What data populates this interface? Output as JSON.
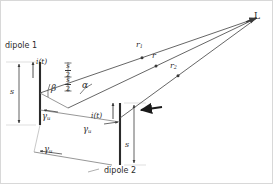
{
  "figure": {
    "type": "antenna-array-geometry-diagram",
    "background_color": "#ffffff",
    "line_color": "#3a3a3a",
    "text_color": "#2b2b2b",
    "observation_point": {
      "label": "L",
      "x": 257,
      "y": 18
    },
    "dipoles": [
      {
        "id": "dipole-1",
        "label": "dipole 1",
        "current_label": "i(t)",
        "length_label": "s",
        "center": {
          "x": 40,
          "y": 93
        },
        "top": {
          "x": 40,
          "y": 62
        },
        "bottom": {
          "x": 40,
          "y": 125
        }
      },
      {
        "id": "dipole-2",
        "label": "dipole 2",
        "current_label": "i(t)",
        "length_label": "s",
        "center": {
          "x": 120,
          "y": 118
        },
        "top": {
          "x": 120,
          "y": 103
        },
        "bottom": {
          "x": 120,
          "y": 165
        }
      }
    ],
    "rays": [
      {
        "id": "ray-r1",
        "label": "r",
        "sublabel": "1",
        "from_x": 40,
        "from_y": 93,
        "to_x": 257,
        "to_y": 18
      },
      {
        "id": "ray-r",
        "label": "r",
        "sublabel": "",
        "from_x": 68,
        "from_y": 108,
        "to_x": 257,
        "to_y": 18
      },
      {
        "id": "ray-r2",
        "label": "r",
        "sublabel": "2",
        "from_x": 120,
        "from_y": 118,
        "to_x": 257,
        "to_y": 18
      }
    ],
    "angles": [
      {
        "id": "angle-beta",
        "label": "β",
        "x": 53,
        "y": 89
      },
      {
        "id": "angle-alpha",
        "label": "α",
        "x": 84,
        "y": 86
      },
      {
        "id": "angle-psi-1",
        "label": "γ",
        "subscript": "u",
        "x": 45,
        "y": 118
      },
      {
        "id": "angle-psi-2",
        "label": "γ",
        "subscript": "u",
        "x": 86,
        "y": 130
      },
      {
        "id": "angle-psi-3",
        "label": "γ",
        "subscript": "u",
        "x": 47,
        "y": 150
      }
    ],
    "half_spacings": [
      {
        "id": "half-spacing-upper",
        "numerator": "s",
        "denominator": "2",
        "x": 68,
        "y": 68
      },
      {
        "id": "half-spacing-lower",
        "numerator": "s",
        "denominator": "2",
        "x": 68,
        "y": 82
      }
    ],
    "dimension_markers": [
      {
        "id": "dim-s-dipole-1",
        "label": "s",
        "x": 13,
        "y": 92
      },
      {
        "id": "dim-s-dipole-2",
        "label": "s",
        "x": 128,
        "y": 145
      }
    ]
  }
}
